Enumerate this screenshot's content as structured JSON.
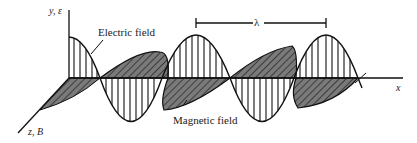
{
  "diagram": {
    "labels": {
      "y_axis": "y, ε",
      "z_axis": "z, B",
      "x_axis": "x",
      "electric_field": "Electric field",
      "magnetic_field": "Magnetic field",
      "wavelength": "λ"
    },
    "colors": {
      "line": "#111111",
      "hatch_fill": "#7a7a7a",
      "background": "#ffffff"
    }
  }
}
